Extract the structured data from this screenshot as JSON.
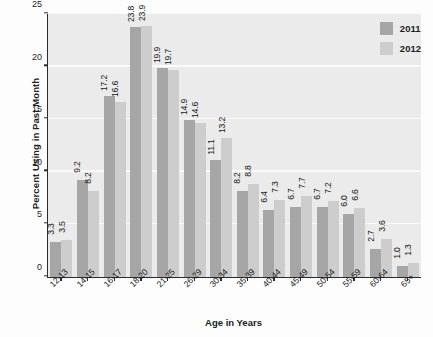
{
  "chart_data": {
    "type": "bar",
    "title": "",
    "xlabel": "Age in Years",
    "ylabel": "Percent Using in Past Month",
    "ylim": [
      0,
      25
    ],
    "yticks": [
      0,
      5,
      10,
      15,
      20,
      25
    ],
    "grid": true,
    "legend_position": "top-right",
    "categories": [
      "12-13",
      "14-15",
      "16-17",
      "18-20",
      "21-25",
      "26-29",
      "30-34",
      "35-39",
      "40-44",
      "45-49",
      "50-54",
      "55-59",
      "60-64",
      "65+"
    ],
    "series": [
      {
        "name": "2011",
        "color": "#a6a6a6",
        "values": [
          3.3,
          9.2,
          17.2,
          23.8,
          19.9,
          14.9,
          11.1,
          8.2,
          6.4,
          6.7,
          6.7,
          6.0,
          2.7,
          1.0
        ]
      },
      {
        "name": "2012",
        "color": "#cdcdcd",
        "values": [
          3.5,
          8.2,
          16.6,
          23.9,
          19.7,
          14.6,
          13.2,
          8.8,
          7.3,
          7.7,
          7.2,
          6.6,
          3.6,
          1.3
        ]
      }
    ]
  },
  "legend": {
    "items": [
      {
        "label": "2011",
        "color": "#a6a6a6"
      },
      {
        "label": "2012",
        "color": "#cdcdcd"
      }
    ]
  },
  "background_text": [
    "Substance Use",
    "Disorder",
    "molina Marijuana and Other",
    "Analgesics (Pa",
    "erence Senior and Future",
    "Directors",
    "the Current Marijuana",
    "Marijuana"
  ]
}
